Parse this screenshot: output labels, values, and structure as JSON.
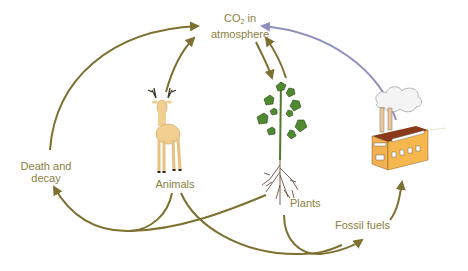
{
  "diagram": {
    "nodes": {
      "co2": {
        "prefix": "CO",
        "subscript": "2",
        "suffix": " in",
        "line2": "atmosphere"
      },
      "death_decay": {
        "line1": "Death and",
        "line2": "decay"
      },
      "animals": {
        "label": "Animals",
        "icon": "deer-icon"
      },
      "plants": {
        "label": "Plants",
        "icon": "plant-icon"
      },
      "fossil_fuels": {
        "label": "Fossil fuels"
      },
      "factory": {
        "icon": "factory-icon"
      }
    },
    "edges": [
      {
        "from": "Death and decay",
        "to": "CO2 in atmosphere"
      },
      {
        "from": "Animals",
        "to": "CO2 in atmosphere"
      },
      {
        "from": "CO2 in atmosphere",
        "to": "Plants"
      },
      {
        "from": "Plants",
        "to": "CO2 in atmosphere"
      },
      {
        "from": "Factory",
        "to": "CO2 in atmosphere"
      },
      {
        "from": "Animals",
        "to": "Death and decay"
      },
      {
        "from": "Plants",
        "to": "Death and decay"
      },
      {
        "from": "Animals",
        "to": "Fossil fuels"
      },
      {
        "from": "Plants",
        "to": "Fossil fuels"
      },
      {
        "from": "Fossil fuels",
        "to": "Factory"
      }
    ],
    "colors": {
      "arrow": "#7d7030",
      "emission_arrow": "#8f8fbf",
      "label": "#8a8040"
    }
  }
}
